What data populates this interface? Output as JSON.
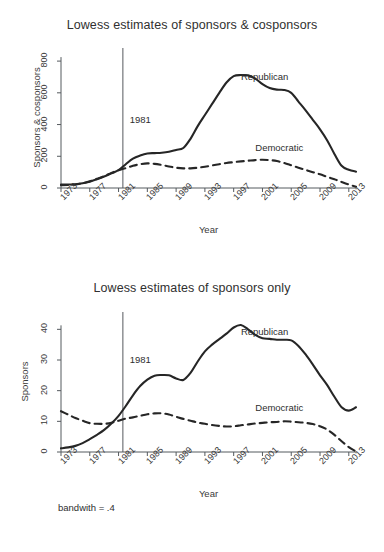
{
  "figure": {
    "footnote": "bandwith = .4",
    "background_color": "#ffffff",
    "line_color": "#262626",
    "axis_color": "#555a5e"
  },
  "chart_data": [
    {
      "type": "line",
      "panel": "top",
      "title": "Lowess estimates of sponsors & cosponsors",
      "xlabel": "Year",
      "ylabel": "Sponsors & cosponsors",
      "xlim": [
        1973,
        2014
      ],
      "ylim": [
        0,
        870
      ],
      "yticks": [
        0,
        200,
        400,
        600,
        800
      ],
      "yticklabels": [
        "0",
        "200",
        "400",
        "600",
        "800"
      ],
      "xticks": [
        1973,
        1977,
        1981,
        1985,
        1989,
        1993,
        1997,
        2001,
        2005,
        2009,
        2013
      ],
      "xticklabels": [
        "1973",
        "1977",
        "1981",
        "1985",
        "1989",
        "1993",
        "1997",
        "2001",
        "2005",
        "2009",
        "2013"
      ],
      "grid": false,
      "legend_position": "inline-annotation",
      "annotations": [
        {
          "text": "1981",
          "x": 1982,
          "y": 430,
          "kind": "vline-label"
        },
        {
          "text": "Republican",
          "x": 1998,
          "y": 700,
          "kind": "series-label"
        },
        {
          "text": "Democratic",
          "x": 2000,
          "y": 250,
          "kind": "series-label"
        }
      ],
      "vline": {
        "x": 1981.6,
        "label": "1981"
      },
      "x": [
        1973,
        1974,
        1975,
        1976,
        1977,
        1978,
        1979,
        1980,
        1981,
        1982,
        1983,
        1984,
        1985,
        1986,
        1987,
        1988,
        1989,
        1990,
        1991,
        1992,
        1993,
        1994,
        1995,
        1996,
        1997,
        1998,
        1999,
        2000,
        2001,
        2002,
        2003,
        2004,
        2005,
        2006,
        2007,
        2008,
        2009,
        2010,
        2011,
        2012,
        2013,
        2014
      ],
      "series": [
        {
          "name": "Republican",
          "style": "solid",
          "values": [
            22,
            22,
            24,
            30,
            40,
            55,
            72,
            92,
            112,
            150,
            185,
            205,
            218,
            220,
            222,
            228,
            240,
            252,
            310,
            390,
            460,
            530,
            600,
            665,
            705,
            712,
            710,
            690,
            655,
            630,
            620,
            618,
            600,
            545,
            490,
            430,
            370,
            300,
            215,
            140,
            115,
            103
          ]
        },
        {
          "name": "Democratic",
          "style": "dashed",
          "values": [
            18,
            19,
            22,
            30,
            42,
            58,
            75,
            95,
            112,
            125,
            140,
            150,
            155,
            152,
            145,
            136,
            128,
            124,
            124,
            128,
            134,
            142,
            150,
            158,
            163,
            168,
            172,
            176,
            178,
            176,
            170,
            158,
            143,
            128,
            114,
            100,
            86,
            70,
            55,
            38,
            22,
            8
          ]
        }
      ]
    },
    {
      "type": "line",
      "panel": "bottom",
      "title": "Lowess estimates of sponsors only",
      "xlabel": "Year",
      "ylabel": "Sponsors",
      "xlim": [
        1973,
        2014
      ],
      "ylim": [
        0,
        45
      ],
      "yticks": [
        0,
        10,
        20,
        30,
        40
      ],
      "yticklabels": [
        "0",
        "10",
        "20",
        "30",
        "40"
      ],
      "xticks": [
        1973,
        1977,
        1981,
        1985,
        1989,
        1993,
        1997,
        2001,
        2005,
        2009,
        2013
      ],
      "xticklabels": [
        "1973",
        "1977",
        "1981",
        "1985",
        "1989",
        "1993",
        "1997",
        "2001",
        "2005",
        "2009",
        "2013"
      ],
      "grid": false,
      "legend_position": "inline-annotation",
      "annotations": [
        {
          "text": "1981",
          "x": 1982,
          "y": 30,
          "kind": "vline-label"
        },
        {
          "text": "Republican",
          "x": 1998,
          "y": 39,
          "kind": "series-label"
        },
        {
          "text": "Democratic",
          "x": 2000,
          "y": 14.5,
          "kind": "series-label"
        }
      ],
      "vline": {
        "x": 1981.6,
        "label": "1981"
      },
      "x": [
        1973,
        1974,
        1975,
        1976,
        1977,
        1978,
        1979,
        1980,
        1981,
        1982,
        1983,
        1984,
        1985,
        1986,
        1987,
        1988,
        1989,
        1990,
        1991,
        1992,
        1993,
        1994,
        1995,
        1996,
        1997,
        1998,
        1999,
        2000,
        2001,
        2002,
        2003,
        2004,
        2005,
        2006,
        2007,
        2008,
        2009,
        2010,
        2011,
        2012,
        2013,
        2014
      ],
      "series": [
        {
          "name": "Republican",
          "style": "solid",
          "values": [
            1.2,
            1.5,
            2.0,
            2.9,
            4.2,
            5.6,
            7.2,
            9.3,
            11.8,
            15.0,
            18.5,
            21.5,
            23.6,
            24.9,
            25.1,
            25.0,
            24.0,
            23.5,
            25.8,
            29.5,
            32.8,
            35.0,
            36.8,
            38.6,
            40.6,
            41.4,
            40.0,
            38.2,
            37.1,
            36.9,
            36.6,
            36.6,
            36.4,
            34.6,
            31.8,
            28.5,
            25.0,
            21.8,
            18.0,
            14.6,
            13.5,
            14.6
          ]
        },
        {
          "name": "Democratic",
          "style": "dashed",
          "values": [
            13.3,
            12.2,
            11.1,
            10.2,
            9.4,
            9.2,
            9.2,
            9.5,
            10.2,
            10.9,
            11.3,
            11.8,
            12.3,
            12.6,
            12.6,
            12.2,
            11.5,
            10.8,
            10.2,
            9.6,
            9.2,
            8.8,
            8.5,
            8.3,
            8.4,
            8.7,
            9.0,
            9.3,
            9.5,
            9.7,
            9.8,
            10.0,
            9.9,
            9.7,
            9.5,
            9.1,
            8.4,
            7.3,
            5.6,
            3.5,
            1.6,
            0.2
          ]
        }
      ]
    }
  ]
}
